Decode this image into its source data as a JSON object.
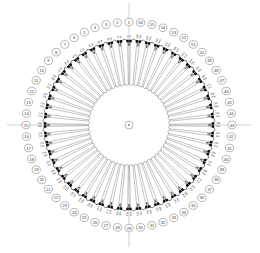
{
  "figure": {
    "center": {
      "x": 129,
      "y": 125
    },
    "geometry": {
      "hub_radius": 4.0,
      "inner_ring_radius": 40.0,
      "leaf_radius": 84.0,
      "badge_radius": 103.0,
      "badge_size": 8.2,
      "axis_half_length": 122
    },
    "style": {
      "background": "#ffffff",
      "spoke_color": "#4a4a4a",
      "bracket_color": "#1a1a1a",
      "axis_color": "#c2c2c2",
      "marker_color": "#0a0a0a",
      "badge_stroke": "#6f6f6f",
      "label_color": "#2e2e2e"
    },
    "axes": [
      {
        "name": "vertical-axis",
        "orientation": "vertical"
      },
      {
        "name": "horizontal-axis",
        "orientation": "horizontal"
      }
    ]
  },
  "chart_data": {
    "type": "dendrogram",
    "xlabel": "",
    "ylabel": "",
    "layout": "polar",
    "grid": false,
    "legend": "none",
    "sector_count": 56,
    "leaf_count": 112,
    "angle_start_deg": 90,
    "angle_direction": "counterclockwise",
    "groups": [
      {
        "id": 1,
        "label": "1",
        "leaves": [
          "1a",
          "1b"
        ]
      },
      {
        "id": 2,
        "label": "2",
        "leaves": [
          "2a",
          "2b"
        ]
      },
      {
        "id": 3,
        "label": "3",
        "leaves": [
          "3a",
          "3b"
        ]
      },
      {
        "id": 4,
        "label": "4",
        "leaves": [
          "4a",
          "4b"
        ]
      },
      {
        "id": 5,
        "label": "5",
        "leaves": [
          "5a",
          "5b"
        ]
      },
      {
        "id": 6,
        "label": "6",
        "leaves": [
          "6a",
          "6b"
        ]
      },
      {
        "id": 7,
        "label": "7",
        "leaves": [
          "7a",
          "7b"
        ]
      },
      {
        "id": 8,
        "label": "8",
        "leaves": [
          "8a",
          "8b"
        ]
      },
      {
        "id": 9,
        "label": "9",
        "leaves": [
          "9a",
          "9b"
        ]
      },
      {
        "id": 10,
        "label": "10",
        "leaves": [
          "10a",
          "10b"
        ]
      },
      {
        "id": 11,
        "label": "11",
        "leaves": [
          "11a",
          "11b"
        ]
      },
      {
        "id": 12,
        "label": "12",
        "leaves": [
          "12a",
          "12b"
        ]
      },
      {
        "id": 13,
        "label": "13",
        "leaves": [
          "13a",
          "13b"
        ]
      },
      {
        "id": 14,
        "label": "14",
        "leaves": [
          "14a",
          "14b"
        ]
      },
      {
        "id": 15,
        "label": "15",
        "leaves": [
          "15a",
          "15b"
        ]
      },
      {
        "id": 16,
        "label": "16",
        "leaves": [
          "16a",
          "16b"
        ]
      },
      {
        "id": 17,
        "label": "17",
        "leaves": [
          "17a",
          "17b"
        ]
      },
      {
        "id": 18,
        "label": "18",
        "leaves": [
          "18a",
          "18b"
        ]
      },
      {
        "id": 19,
        "label": "19",
        "leaves": [
          "19a",
          "19b"
        ]
      },
      {
        "id": 20,
        "label": "20",
        "leaves": [
          "20a",
          "20b"
        ]
      },
      {
        "id": 21,
        "label": "21",
        "leaves": [
          "21a",
          "21b"
        ]
      },
      {
        "id": 22,
        "label": "22",
        "leaves": [
          "22a",
          "22b"
        ]
      },
      {
        "id": 23,
        "label": "23",
        "leaves": [
          "23a",
          "23b"
        ]
      },
      {
        "id": 24,
        "label": "24",
        "leaves": [
          "24a",
          "24b"
        ]
      },
      {
        "id": 25,
        "label": "25",
        "leaves": [
          "25a",
          "25b"
        ]
      },
      {
        "id": 26,
        "label": "26",
        "leaves": [
          "26a",
          "26b"
        ]
      },
      {
        "id": 27,
        "label": "27",
        "leaves": [
          "27a",
          "27b"
        ]
      },
      {
        "id": 28,
        "label": "28",
        "leaves": [
          "28a",
          "28b"
        ]
      },
      {
        "id": 29,
        "label": "29",
        "leaves": [
          "29a",
          "29b"
        ]
      },
      {
        "id": 30,
        "label": "30",
        "leaves": [
          "30a",
          "30b"
        ]
      },
      {
        "id": 31,
        "label": "31",
        "leaves": [
          "31a",
          "31b"
        ]
      },
      {
        "id": 32,
        "label": "32",
        "leaves": [
          "32a",
          "32b"
        ]
      },
      {
        "id": 33,
        "label": "33",
        "leaves": [
          "33a",
          "33b"
        ]
      },
      {
        "id": 34,
        "label": "34",
        "leaves": [
          "34a",
          "34b"
        ]
      },
      {
        "id": 35,
        "label": "35",
        "leaves": [
          "35a",
          "35b"
        ]
      },
      {
        "id": 36,
        "label": "36",
        "leaves": [
          "36a",
          "36b"
        ]
      },
      {
        "id": 37,
        "label": "37",
        "leaves": [
          "37a",
          "37b"
        ]
      },
      {
        "id": 38,
        "label": "38",
        "leaves": [
          "38a",
          "38b"
        ]
      },
      {
        "id": 39,
        "label": "39",
        "leaves": [
          "39a",
          "39b"
        ]
      },
      {
        "id": 40,
        "label": "40",
        "leaves": [
          "40a",
          "40b"
        ]
      },
      {
        "id": 41,
        "label": "41",
        "leaves": [
          "41a",
          "41b"
        ]
      },
      {
        "id": 42,
        "label": "42",
        "leaves": [
          "42a",
          "42b"
        ]
      },
      {
        "id": 43,
        "label": "43",
        "leaves": [
          "43a",
          "43b"
        ]
      },
      {
        "id": 44,
        "label": "44",
        "leaves": [
          "44a",
          "44b"
        ]
      },
      {
        "id": 45,
        "label": "45",
        "leaves": [
          "45a",
          "45b"
        ]
      },
      {
        "id": 46,
        "label": "46",
        "leaves": [
          "46a",
          "46b"
        ]
      },
      {
        "id": 47,
        "label": "47",
        "leaves": [
          "47a",
          "47b"
        ]
      },
      {
        "id": 48,
        "label": "48",
        "leaves": [
          "48a",
          "48b"
        ]
      },
      {
        "id": 49,
        "label": "49",
        "leaves": [
          "49a",
          "49b"
        ]
      },
      {
        "id": 50,
        "label": "50",
        "leaves": [
          "50a",
          "50b"
        ]
      },
      {
        "id": 51,
        "label": "51",
        "leaves": [
          "51a",
          "51b"
        ]
      },
      {
        "id": 52,
        "label": "52",
        "leaves": [
          "52a",
          "52b"
        ]
      },
      {
        "id": 53,
        "label": "53",
        "leaves": [
          "53a",
          "53b"
        ]
      },
      {
        "id": 54,
        "label": "54",
        "leaves": [
          "54a",
          "54b"
        ]
      },
      {
        "id": 55,
        "label": "55",
        "leaves": [
          "55a",
          "55b"
        ]
      },
      {
        "id": 56,
        "label": "56",
        "leaves": [
          "56a",
          "56b"
        ]
      }
    ]
  }
}
